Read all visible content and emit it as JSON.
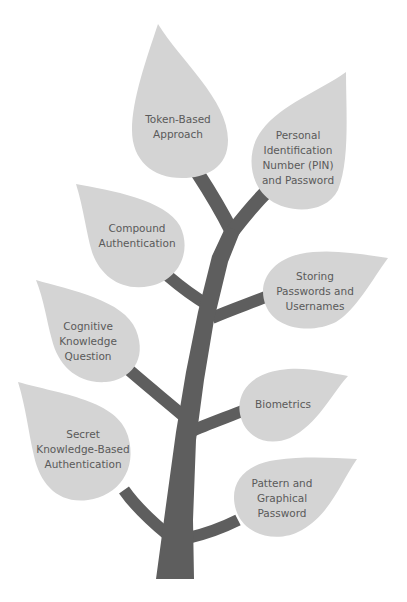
{
  "diagram": {
    "type": "tree",
    "colors": {
      "background": "#ffffff",
      "leaf": "#d4d4d4",
      "trunk": "#5e5e5e",
      "text": "#5a5a5a"
    },
    "leaves": [
      {
        "id": "token-based",
        "lines": [
          "Token-Based",
          "Approach"
        ]
      },
      {
        "id": "pin-password",
        "lines": [
          "Personal",
          "Identification",
          "Number (PIN)",
          "and Password"
        ]
      },
      {
        "id": "compound",
        "lines": [
          "Compound",
          "Authentication"
        ]
      },
      {
        "id": "storing",
        "lines": [
          "Storing",
          "Passwords and",
          "Usernames"
        ]
      },
      {
        "id": "cognitive",
        "lines": [
          "Cognitive",
          "Knowledge",
          "Question"
        ]
      },
      {
        "id": "biometrics",
        "lines": [
          "Biometrics"
        ]
      },
      {
        "id": "secret-knowledge",
        "lines": [
          "Secret",
          "Knowledge-Based",
          "Authentication"
        ]
      },
      {
        "id": "pattern-graphical",
        "lines": [
          "Pattern and",
          "Graphical",
          "Password"
        ]
      }
    ]
  }
}
